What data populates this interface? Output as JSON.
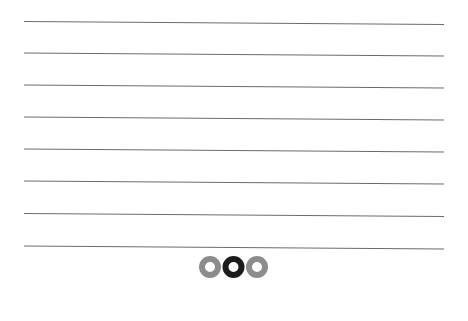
{
  "lines": {
    "x_start": 24,
    "x_end": 444,
    "rows": [
      {
        "y_left": 21.5,
        "y_right": 24.5
      },
      {
        "y_left": 53,
        "y_right": 56
      },
      {
        "y_left": 85,
        "y_right": 88
      },
      {
        "y_left": 117,
        "y_right": 120
      },
      {
        "y_left": 149,
        "y_right": 152
      },
      {
        "y_left": 181,
        "y_right": 184
      },
      {
        "y_left": 213.5,
        "y_right": 216.5
      },
      {
        "y_left": 246,
        "y_right": 249
      }
    ],
    "color": "#6b6b6b"
  },
  "pager": {
    "dots": [
      {
        "label": "page 1",
        "active": false
      },
      {
        "label": "page 2",
        "active": true
      },
      {
        "label": "page 3",
        "active": false
      }
    ],
    "active_color": "#1c1c1c",
    "inactive_color": "#8c8c8c"
  }
}
